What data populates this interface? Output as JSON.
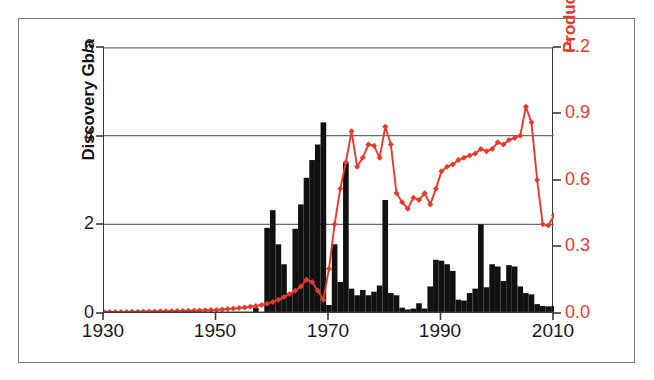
{
  "chart_data": {
    "type": "bar",
    "title": "",
    "subtitle": "",
    "xlabel": "",
    "ylabel": "Discovery Gb/a",
    "y2label": "Production Gb/a",
    "xlim": [
      1930,
      2010
    ],
    "ylim": [
      0,
      6
    ],
    "y2lim": [
      0.0,
      1.2
    ],
    "grid": true,
    "gridlines_y": [
      2,
      4
    ],
    "legend_position": "none",
    "xticks": [
      "1930",
      "1950",
      "1970",
      "1990",
      "2010"
    ],
    "xtick_values": [
      1930,
      1950,
      1970,
      1990,
      2010
    ],
    "yticks_left": [
      "0",
      "2",
      "4",
      "6"
    ],
    "ytick_values_left": [
      0,
      2,
      4,
      6
    ],
    "yticks_right": [
      "0.0",
      "0.3",
      "0.6",
      "0.9",
      "1.2"
    ],
    "ytick_values_right": [
      0.0,
      0.3,
      0.6,
      0.9,
      1.2
    ],
    "colors": {
      "bars": "#111111",
      "line": "#e8392b",
      "axis": "#3a3a3a",
      "grid": "#6b6b6b",
      "left_axis_text": "#1a1a1a",
      "right_axis_text": "#e8392b",
      "background": "#ffffff",
      "frame": "#7a7a7a"
    },
    "series": [
      {
        "name": "Discovery Gb/a",
        "type": "bar",
        "axis": "left",
        "color": "#111111",
        "x": [
          1930,
          1931,
          1932,
          1933,
          1934,
          1935,
          1936,
          1937,
          1938,
          1939,
          1940,
          1941,
          1942,
          1943,
          1944,
          1945,
          1946,
          1947,
          1948,
          1949,
          1950,
          1951,
          1952,
          1953,
          1954,
          1955,
          1956,
          1957,
          1958,
          1959,
          1960,
          1961,
          1962,
          1963,
          1964,
          1965,
          1966,
          1967,
          1968,
          1969,
          1970,
          1971,
          1972,
          1973,
          1974,
          1975,
          1976,
          1977,
          1978,
          1979,
          1980,
          1981,
          1982,
          1983,
          1984,
          1985,
          1986,
          1987,
          1988,
          1989,
          1990,
          1991,
          1992,
          1993,
          1994,
          1995,
          1996,
          1997,
          1998,
          1999,
          2000,
          2001,
          2002,
          2003,
          2004,
          2005,
          2006,
          2007,
          2008,
          2009,
          2010
        ],
        "values": [
          0.0,
          0.0,
          0.0,
          0.0,
          0.0,
          0.0,
          0.0,
          0.0,
          0.0,
          0.0,
          0.0,
          0.0,
          0.0,
          0.0,
          0.0,
          0.0,
          0.0,
          0.0,
          0.0,
          0.0,
          0.0,
          0.0,
          0.0,
          0.0,
          0.0,
          0.0,
          0.0,
          0.12,
          0.0,
          1.92,
          2.32,
          1.55,
          1.1,
          0.45,
          1.9,
          2.45,
          3.05,
          3.45,
          3.8,
          4.3,
          0.18,
          1.55,
          0.7,
          3.4,
          0.55,
          0.4,
          0.52,
          0.4,
          0.48,
          0.62,
          2.55,
          0.45,
          0.4,
          0.12,
          0.08,
          0.1,
          0.22,
          0.1,
          0.6,
          1.2,
          1.18,
          1.1,
          0.95,
          0.3,
          0.28,
          0.45,
          0.55,
          2.0,
          0.58,
          1.1,
          1.05,
          0.72,
          1.08,
          1.05,
          0.6,
          0.45,
          0.42,
          0.2,
          0.16,
          0.15,
          0.16
        ]
      },
      {
        "name": "Production Gb/a",
        "type": "line",
        "axis": "right",
        "color": "#e8392b",
        "marker": "diamond",
        "x": [
          1930,
          1931,
          1932,
          1933,
          1934,
          1935,
          1936,
          1937,
          1938,
          1939,
          1940,
          1941,
          1942,
          1943,
          1944,
          1945,
          1946,
          1947,
          1948,
          1949,
          1950,
          1951,
          1952,
          1953,
          1954,
          1955,
          1956,
          1957,
          1958,
          1959,
          1960,
          1961,
          1962,
          1963,
          1964,
          1965,
          1966,
          1967,
          1968,
          1969,
          1970,
          1971,
          1972,
          1973,
          1974,
          1975,
          1976,
          1977,
          1978,
          1979,
          1980,
          1981,
          1982,
          1983,
          1984,
          1985,
          1986,
          1987,
          1988,
          1989,
          1990,
          1991,
          1992,
          1993,
          1994,
          1995,
          1996,
          1997,
          1998,
          1999,
          2000,
          2001,
          2002,
          2003,
          2004,
          2005,
          2006,
          2007,
          2008,
          2009,
          2010
        ],
        "values": [
          0.005,
          0.005,
          0.005,
          0.005,
          0.005,
          0.006,
          0.006,
          0.007,
          0.007,
          0.007,
          0.008,
          0.008,
          0.008,
          0.009,
          0.009,
          0.01,
          0.01,
          0.011,
          0.012,
          0.013,
          0.014,
          0.016,
          0.018,
          0.02,
          0.022,
          0.025,
          0.028,
          0.032,
          0.036,
          0.042,
          0.05,
          0.06,
          0.072,
          0.086,
          0.1,
          0.12,
          0.15,
          0.14,
          0.1,
          0.06,
          0.2,
          0.4,
          0.56,
          0.68,
          0.82,
          0.66,
          0.7,
          0.76,
          0.755,
          0.7,
          0.84,
          0.76,
          0.54,
          0.5,
          0.47,
          0.52,
          0.51,
          0.54,
          0.49,
          0.56,
          0.64,
          0.66,
          0.67,
          0.69,
          0.7,
          0.71,
          0.72,
          0.74,
          0.73,
          0.74,
          0.77,
          0.76,
          0.78,
          0.79,
          0.8,
          0.93,
          0.86,
          0.6,
          0.4,
          0.395,
          0.44
        ]
      }
    ]
  },
  "axes": {
    "left": {
      "title": "Discovery Gb/a",
      "ticks": [
        "0",
        "2",
        "4",
        "6"
      ]
    },
    "right": {
      "title": "Production Gb/a",
      "ticks": [
        "0.0",
        "0.3",
        "0.6",
        "0.9",
        "1.2"
      ]
    },
    "bottom": {
      "ticks": [
        "1930",
        "1950",
        "1970",
        "1990",
        "2010"
      ]
    }
  }
}
